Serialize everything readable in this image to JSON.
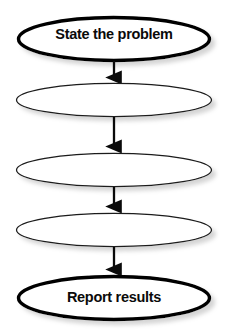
{
  "diagram": {
    "type": "flowchart",
    "orientation": "vertical",
    "title": "",
    "shape": "ellipse",
    "stroke_color": "#000000",
    "fill_color": "#ffffff",
    "text_color": "#0a0a0a",
    "shadow_color": "#c8c8c8",
    "nodes": [
      {
        "id": "node-1",
        "label": "State the problem",
        "shape": "ellipse",
        "emphasis": "strong",
        "stroke_width": 3.4,
        "cx": 114,
        "cy": 39,
        "rx": 96,
        "ry": 22
      },
      {
        "id": "node-2",
        "label": "",
        "shape": "ellipse",
        "emphasis": "normal",
        "stroke_width": 1.2,
        "cx": 114,
        "cy": 100,
        "rx": 98,
        "ry": 17
      },
      {
        "id": "node-3",
        "label": "",
        "shape": "ellipse",
        "emphasis": "normal",
        "stroke_width": 1.2,
        "cx": 114,
        "cy": 170,
        "rx": 98,
        "ry": 17
      },
      {
        "id": "node-4",
        "label": "",
        "shape": "ellipse",
        "emphasis": "normal",
        "stroke_width": 1.2,
        "cx": 114,
        "cy": 230,
        "rx": 98,
        "ry": 17
      },
      {
        "id": "node-5",
        "label": "Report results",
        "shape": "ellipse",
        "emphasis": "strong",
        "stroke_width": 3.4,
        "cx": 114,
        "cy": 298,
        "rx": 96,
        "ry": 22
      }
    ],
    "connectors": [
      {
        "id": "arrow-1",
        "from": "node-1",
        "to": "node-2",
        "direction": "down",
        "x": 114,
        "y1": 61,
        "y2": 83
      },
      {
        "id": "arrow-2",
        "from": "node-2",
        "to": "node-3",
        "direction": "down",
        "x": 114,
        "y1": 117,
        "y2": 152
      },
      {
        "id": "arrow-3",
        "from": "node-3",
        "to": "node-4",
        "direction": "down",
        "x": 114,
        "y1": 187,
        "y2": 212
      },
      {
        "id": "arrow-4",
        "from": "node-4",
        "to": "node-5",
        "direction": "down",
        "x": 114,
        "y1": 247,
        "y2": 275
      }
    ]
  }
}
